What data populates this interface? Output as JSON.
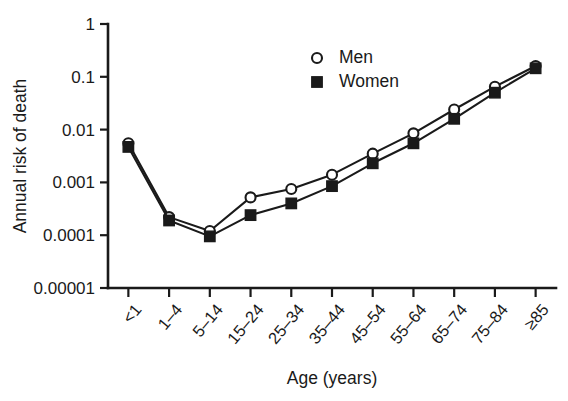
{
  "chart_data": {
    "type": "line",
    "title": "",
    "xlabel": "Age (years)",
    "ylabel": "Annual risk of death",
    "yscale": "log",
    "ylim": [
      1e-05,
      1
    ],
    "grid": false,
    "legend_position": "top-center",
    "ytick_labels": [
      "1",
      "0.1",
      "0.01",
      "0.001",
      "0.0001",
      "0.00001"
    ],
    "ytick_values": [
      1,
      0.1,
      0.01,
      0.001,
      0.0001,
      1e-05
    ],
    "categories": [
      "<1",
      "1–4",
      "5–14",
      "15–24",
      "25–34",
      "35–44",
      "45–54",
      "55–64",
      "65–74",
      "75–84",
      "≥85"
    ],
    "series": [
      {
        "name": "Men",
        "marker": "open-circle",
        "values": [
          0.0055,
          0.00022,
          0.00012,
          0.00052,
          0.00075,
          0.0014,
          0.0035,
          0.0085,
          0.024,
          0.065,
          0.16
        ]
      },
      {
        "name": "Women",
        "marker": "filled-square",
        "values": [
          0.0047,
          0.00019,
          9.5e-05,
          0.00024,
          0.0004,
          0.00085,
          0.0023,
          0.0055,
          0.016,
          0.05,
          0.145
        ]
      }
    ],
    "colors": {
      "axis": "#1a1a1a",
      "men": "#1a1a1a",
      "women": "#1a1a1a",
      "background": "#ffffff"
    }
  }
}
